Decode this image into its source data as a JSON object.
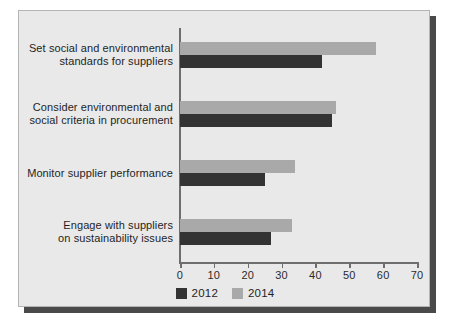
{
  "chart_data": {
    "type": "bar",
    "orientation": "horizontal",
    "title": "",
    "subtitle": "",
    "xlabel": "",
    "ylabel": "",
    "xlim": [
      0,
      70
    ],
    "xticks": [
      0,
      10,
      20,
      30,
      40,
      50,
      60,
      70
    ],
    "xtick_labels": [
      "0",
      "10",
      "20",
      "30",
      "40",
      "50",
      "60",
      "70"
    ],
    "grid": false,
    "legend_position": "bottom-center",
    "categories": [
      "Set social and environmental standards for suppliers",
      "Consider environmental and social criteria in procurement",
      "Monitor supplier performance",
      "Engage with suppliers on sustainability issues"
    ],
    "category_lines": [
      [
        "Set social and environmental",
        "standards for suppliers"
      ],
      [
        "Consider environmental and",
        "social criteria in procurement"
      ],
      [
        "Monitor supplier performance"
      ],
      [
        "Engage with suppliers",
        "on sustainability issues"
      ]
    ],
    "series": [
      {
        "name": "2012",
        "color": "#333333",
        "values": [
          42,
          45,
          25,
          27
        ]
      },
      {
        "name": "2014",
        "color": "#a9a9a9",
        "values": [
          58,
          46,
          34,
          33
        ]
      }
    ]
  },
  "legend": {
    "items": [
      {
        "label": "2012",
        "color": "#333333"
      },
      {
        "label": "2014",
        "color": "#a9a9a9"
      }
    ]
  },
  "colors": {
    "panel_background": "#e9e9e9",
    "panel_border": "#b4b4b4",
    "axis": "#6e6e6e",
    "text": "#1f1f1f",
    "shadow": "#4a4a4a"
  }
}
